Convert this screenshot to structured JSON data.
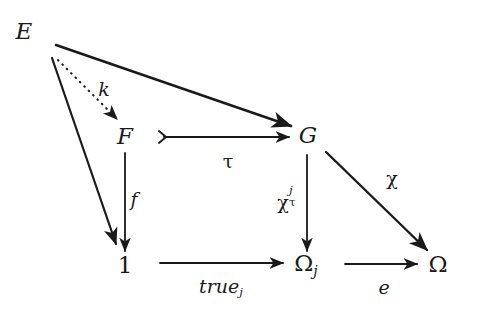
{
  "diagram": {
    "kind": "category-theory-commutative-diagram",
    "background_color": "#ffffff",
    "ink_color": "#1a1a1a",
    "nodes": [
      {
        "id": "E",
        "label": "E",
        "x": 24,
        "y": 31
      },
      {
        "id": "F",
        "label": "F",
        "x": 125,
        "y": 136
      },
      {
        "id": "G",
        "label": "G",
        "x": 308,
        "y": 135
      },
      {
        "id": "one",
        "label": "1",
        "x": 125,
        "y": 265
      },
      {
        "id": "Omegaj",
        "label": "Ω",
        "sub": "j",
        "x": 306,
        "y": 265
      },
      {
        "id": "Omega",
        "label": "Ω",
        "x": 438,
        "y": 264
      }
    ],
    "edges": [
      {
        "id": "k",
        "from": "E",
        "to": "F",
        "label": "k",
        "label_x": 104,
        "label_y": 89,
        "style": "dotted",
        "head": "arrow"
      },
      {
        "id": "EG",
        "from": "E",
        "to": "G",
        "label": "",
        "label_x": 0,
        "label_y": 0,
        "style": "solid",
        "head": "arrow"
      },
      {
        "id": "E1",
        "from": "E",
        "to": "one",
        "label": "",
        "label_x": 0,
        "label_y": 0,
        "style": "solid",
        "head": "arrow"
      },
      {
        "id": "tau",
        "from": "F",
        "to": "G",
        "label": "τ",
        "label_x": 228,
        "label_y": 161,
        "style": "solid",
        "head": "arrow",
        "tail": "mono"
      },
      {
        "id": "f",
        "from": "F",
        "to": "one",
        "label": "f",
        "label_x": 134,
        "label_y": 199,
        "style": "solid",
        "head": "arrow"
      },
      {
        "id": "chitauj",
        "from": "G",
        "to": "Omegaj",
        "label": "χ",
        "sup": "j",
        "sub": "τ",
        "label_x": 289,
        "label_y": 201,
        "style": "solid",
        "head": "arrow"
      },
      {
        "id": "truej",
        "from": "one",
        "to": "Omegaj",
        "label": "true",
        "sub": "j",
        "label_x": 221,
        "label_y": 288,
        "style": "solid",
        "head": "arrow"
      },
      {
        "id": "e",
        "from": "Omegaj",
        "to": "Omega",
        "label": "e",
        "label_x": 384,
        "label_y": 287,
        "style": "solid",
        "head": "arrow"
      },
      {
        "id": "chi",
        "from": "G",
        "to": "Omega",
        "label": "χ",
        "label_x": 392,
        "label_y": 178,
        "style": "solid",
        "head": "arrow"
      }
    ]
  }
}
